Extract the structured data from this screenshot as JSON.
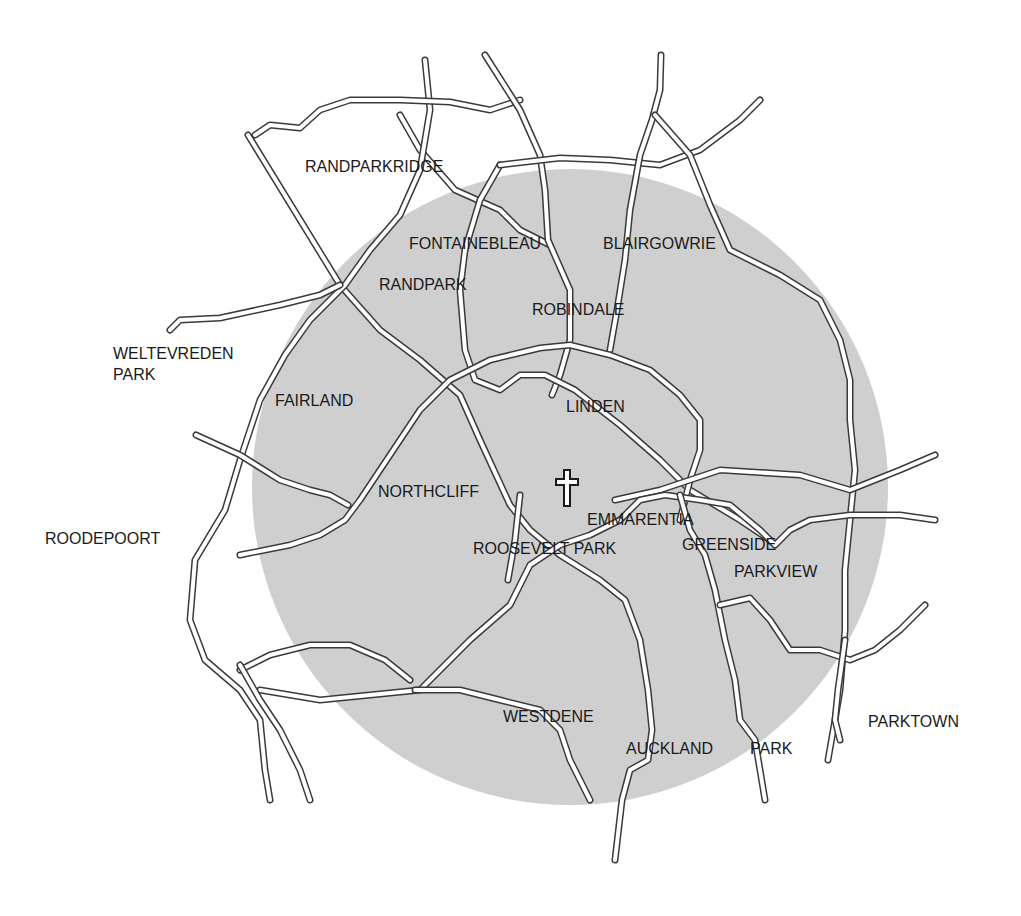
{
  "map": {
    "background_color": "#ffffff",
    "area_circle": {
      "cx": 570,
      "cy": 487,
      "r": 318,
      "color": "#cfcfcf"
    },
    "road_color": "#3a3a3a",
    "road_fill": "#ffffff",
    "landmark": {
      "icon": "church-cross-icon",
      "x": 557,
      "y": 470
    }
  },
  "labels": {
    "randparkridge": "RANDPARKRIDGE",
    "fontainebleau": "FONTAINEBLEAU",
    "blairgowrie": "BLAIRGOWRIE",
    "randpark": "RANDPARK",
    "robindale": "ROBINDALE",
    "weltevreden_line1": "WELTEVREDEN",
    "weltevreden_line2": "PARK",
    "fairland": "FAIRLAND",
    "linden": "LINDEN",
    "northcliff": "NORTHCLIFF",
    "emmarentia": "EMMARENTIA",
    "roodepoort": "ROODEPOORT",
    "roosevelt_park": "ROOSEVELT PARK",
    "greenside": "GREENSIDE",
    "parkview": "PARKVIEW",
    "westdene": "WESTDENE",
    "auckland": "AUCKLAND",
    "auckland_park": "PARK",
    "parktown": "PARKTOWN"
  }
}
